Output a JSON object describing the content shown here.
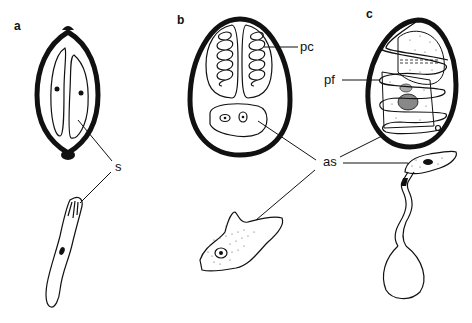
{
  "figure": {
    "panels": [
      {
        "id": "a",
        "label": "a",
        "description": "Spore with two elongate polar capsules/sporoplasms and emerging sporozoite"
      },
      {
        "id": "b",
        "label": "b",
        "description": "Spore with two polar capsules containing coiled filaments and binucleate amoeboid sporoplasm"
      },
      {
        "id": "c",
        "label": "c",
        "description": "Spore with coiled polar filament around sporoplasm; germinating with extruded tube"
      }
    ],
    "labels": {
      "s": "s",
      "pc": "pc",
      "pf": "pf",
      "as": "as"
    }
  }
}
